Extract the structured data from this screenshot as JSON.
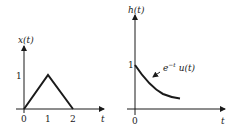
{
  "left_plot": {
    "ylabel": "x(t)",
    "xlabel": "t",
    "x_ticks": [
      "0",
      "1",
      "2"
    ],
    "y_ticks": [
      "1"
    ],
    "points": [
      [
        0,
        0
      ],
      [
        1,
        1
      ],
      [
        2,
        0
      ]
    ]
  },
  "right_plot": {
    "ylabel": "h(t)",
    "xlabel": "t",
    "x_ticks": [
      "0"
    ],
    "y_ticks": [
      "1"
    ],
    "annotation_base": "e",
    "annotation_exp": "−t",
    "annotation_rest": " u(t)"
  },
  "colors": {
    "stroke": "#1a1a1a"
  }
}
